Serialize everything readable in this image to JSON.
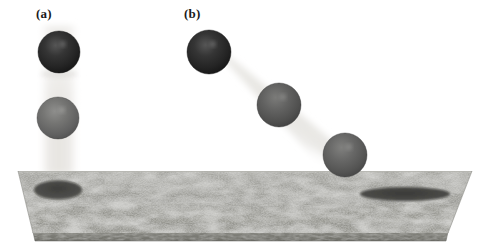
{
  "figure": {
    "width": 491,
    "height": 251,
    "background_color": "#ffffff"
  },
  "panels": [
    {
      "id": "a",
      "label": "(a)",
      "label_x": 36,
      "label_y": 6,
      "trajectory": "vertical",
      "beam": {
        "type": "vertical-streak",
        "x": 38,
        "y": 28,
        "width": 42,
        "height": 145,
        "color": "#efeeec"
      },
      "spheres": [
        {
          "index": 1,
          "cx": 59,
          "cy": 52,
          "r": 21,
          "color": "#2b2b2b",
          "shade": "dark"
        },
        {
          "index": 2,
          "cx": 58,
          "cy": 118,
          "r": 21,
          "color": "#6d6d6d",
          "shade": "mid"
        }
      ],
      "crater": {
        "cx": 58,
        "cy": 190,
        "rx": 24,
        "ry": 9,
        "color": "#4a4a47",
        "shape": "round-ellipse"
      }
    },
    {
      "id": "b",
      "label": "(b)",
      "label_x": 184,
      "label_y": 6,
      "trajectory": "oblique",
      "beam": {
        "type": "diagonal-streak",
        "x1": 212,
        "y1": 46,
        "x2": 352,
        "y2": 160,
        "thickness": 42,
        "color": "#efeeec"
      },
      "spheres": [
        {
          "index": 1,
          "cx": 209,
          "cy": 52,
          "r": 22,
          "color": "#2b2b2b",
          "shade": "dark"
        },
        {
          "index": 2,
          "cx": 279,
          "cy": 105,
          "r": 22,
          "color": "#585858",
          "shade": "mid"
        },
        {
          "index": 3,
          "cx": 345,
          "cy": 155,
          "r": 22,
          "color": "#5e5e5e",
          "shade": "mid"
        }
      ],
      "crater": {
        "cx": 405,
        "cy": 194,
        "rx": 45,
        "ry": 7,
        "color": "#4a4a47",
        "shape": "elongated-ellipse"
      }
    }
  ],
  "surface": {
    "name": "granular-plate",
    "top_left": {
      "x": 18,
      "y": 171
    },
    "top_right": {
      "x": 472,
      "y": 171
    },
    "bottom_right": {
      "x": 448,
      "y": 233
    },
    "bottom_left": {
      "x": 33,
      "y": 233
    },
    "edge_thickness": 8,
    "base_color": "#9a9a95",
    "texture_color_dark": "#6a6a66",
    "texture_color_light": "#bdbdb7",
    "edge_color": "#7e7e79"
  },
  "colors": {
    "sphere_dark": "#2b2b2b",
    "sphere_mid": "#6d6d6d",
    "beam_light": "#efeeec",
    "plate_base": "#9a9a95",
    "crater": "#4a4a47",
    "label_text": "#1a1a1a"
  }
}
